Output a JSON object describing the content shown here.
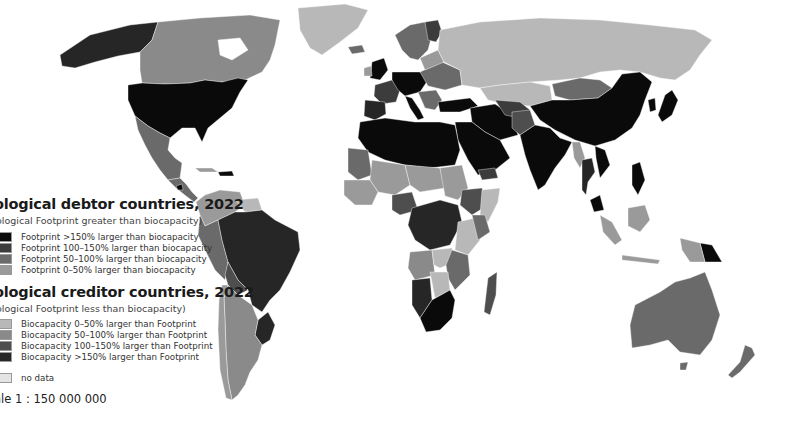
{
  "legend": {
    "debtor": {
      "title": "ological debtor countries, 2022",
      "subtitle": "ological Footprint greater than biocapacity)",
      "items": [
        {
          "label": "Footprint >150% larger than biocapacity",
          "color": "#0a0a0a"
        },
        {
          "label": "Footprint 100–150% larger than biocapacity",
          "color": "#3c3c3c"
        },
        {
          "label": "Footprint 50–100% larger than biocapacity",
          "color": "#6a6a6a"
        },
        {
          "label": "Footprint 0–50% larger than biocapacity",
          "color": "#9a9a9a"
        }
      ]
    },
    "creditor": {
      "title": "ological creditor countries, 2022",
      "subtitle": "ological Footprint less than biocapacity)",
      "items": [
        {
          "label": "Biocapacity 0–50% larger than Footprint",
          "color": "#b8b8b8"
        },
        {
          "label": "Biocapacity 50–100% larger than Footprint",
          "color": "#8a8a8a"
        },
        {
          "label": "Biocapacity 100–150% larger than Footprint",
          "color": "#4e4e4e"
        },
        {
          "label": "Biocapacity >150% larger than Footprint",
          "color": "#262626"
        }
      ]
    },
    "no_data": {
      "label": "no data",
      "color": "#e4e4e4"
    }
  },
  "scale_label": "ale 1 : 150 000 000",
  "colors": {
    "ocean": "#ffffff",
    "deb_150": "#0a0a0a",
    "deb_100": "#3c3c3c",
    "deb_50": "#6a6a6a",
    "deb_0": "#9a9a9a",
    "cred_0": "#b8b8b8",
    "cred_50": "#8a8a8a",
    "cred_100": "#4e4e4e",
    "cred_150": "#262626",
    "no_data": "#e4e4e4"
  }
}
